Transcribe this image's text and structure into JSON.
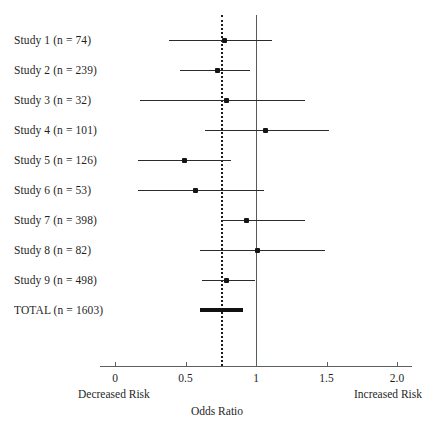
{
  "chart_data": {
    "type": "scatter",
    "chart_subtype": "forest-plot",
    "title": "",
    "xlabel": "Odds Ratio",
    "ylabel": "",
    "xlim": [
      0,
      2.0
    ],
    "xticks": [
      0,
      0.5,
      1,
      1.5,
      2.0
    ],
    "xtick_labels": [
      "0",
      "0.5",
      "1",
      "1.5",
      "2.0"
    ],
    "grid": false,
    "legend": null,
    "left_axis_note": "Decreased Risk",
    "right_axis_note": "Increased Risk",
    "reference_lines": [
      {
        "name": "null-effect-line",
        "value": 1.0,
        "style": "solid",
        "color": "#555a5e"
      },
      {
        "name": "pooled-estimate-line",
        "value": 0.75,
        "style": "dotted",
        "color": "#1b1b1b"
      }
    ],
    "rows": [
      {
        "label": "Study 1 (n = 74)",
        "estimate": 0.78,
        "ci_low": 0.38,
        "ci_high": 1.11,
        "summary": false
      },
      {
        "label": "Study 2 (n = 239)",
        "estimate": 0.73,
        "ci_low": 0.46,
        "ci_high": 0.96,
        "summary": false
      },
      {
        "label": "Study 3 (n = 32)",
        "estimate": 0.79,
        "ci_low": 0.18,
        "ci_high": 1.35,
        "summary": false
      },
      {
        "label": "Study 4 (n = 101)",
        "estimate": 1.07,
        "ci_low": 0.64,
        "ci_high": 1.52,
        "summary": false
      },
      {
        "label": "Study 5 (n = 126)",
        "estimate": 0.49,
        "ci_low": 0.16,
        "ci_high": 0.82,
        "summary": false
      },
      {
        "label": "Study 6 (n = 53)",
        "estimate": 0.57,
        "ci_low": 0.16,
        "ci_high": 1.06,
        "summary": false
      },
      {
        "label": "Study 7 (n = 398)",
        "estimate": 0.93,
        "ci_low": 0.76,
        "ci_high": 1.35,
        "summary": false
      },
      {
        "label": "Study 8 (n = 82)",
        "estimate": 1.01,
        "ci_low": 0.6,
        "ci_high": 1.49,
        "summary": false
      },
      {
        "label": "Study 9 (n = 498)",
        "estimate": 0.79,
        "ci_low": 0.62,
        "ci_high": 0.99,
        "summary": false
      },
      {
        "label": "TOTAL (n = 1603)",
        "estimate": 0.75,
        "ci_low": 0.6,
        "ci_high": 0.91,
        "summary": true
      }
    ]
  },
  "geometry": {
    "x_zero_px": 115,
    "x_unit_px": 141,
    "row_top_px": 40,
    "row_step_px": 30,
    "vline_top_px": 15,
    "vline_bottom_px": 366,
    "axis_y_px": 366,
    "axis_left_px": 100,
    "axis_right_px": 412
  }
}
